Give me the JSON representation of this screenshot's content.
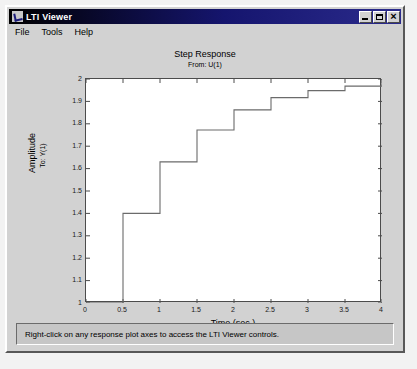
{
  "window": {
    "title": "LTI Viewer",
    "icon": "matlab-figure-icon",
    "buttons": {
      "minimize": "minimize-button",
      "maximize": "maximize-button",
      "close": "close-button"
    }
  },
  "menubar": {
    "items": [
      {
        "label": "File"
      },
      {
        "label": "Tools"
      },
      {
        "label": "Help"
      }
    ]
  },
  "statusbar": {
    "message": "Right-click on any response plot axes to access the LTI Viewer controls."
  },
  "chart_data": {
    "type": "line",
    "title": "Step Response",
    "subtitle": "From: U(1)",
    "xlabel": "Time (sec.)",
    "ylabel": "Amplitude",
    "ylabel_sub": "To: Y(1)",
    "xlim": [
      0,
      4
    ],
    "ylim": [
      1,
      2
    ],
    "grid": false,
    "legend": false,
    "line_color": "#666666",
    "xticks": [
      "0",
      "0.5",
      "1",
      "1.5",
      "2",
      "2.5",
      "3",
      "3.5",
      "4"
    ],
    "xtick_values": [
      0,
      0.5,
      1,
      1.5,
      2,
      2.5,
      3,
      3.5,
      4
    ],
    "yticks": [
      "1",
      "1.1",
      "1.2",
      "1.3",
      "1.4",
      "1.5",
      "1.6",
      "1.7",
      "1.8",
      "1.9",
      "2"
    ],
    "ytick_values": [
      1,
      1.1,
      1.2,
      1.3,
      1.4,
      1.5,
      1.6,
      1.7,
      1.8,
      1.9,
      2
    ],
    "series": [
      {
        "name": "Step Response",
        "style": "staircase",
        "x": [
          0,
          0.5,
          1,
          1.5,
          2,
          2.5,
          3,
          3.5,
          4
        ],
        "values": [
          1.0,
          1.4,
          1.63,
          1.772,
          1.862,
          1.917,
          1.948,
          1.968,
          1.981
        ]
      }
    ]
  }
}
